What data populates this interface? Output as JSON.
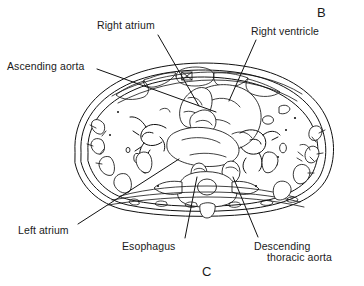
{
  "figure": {
    "type": "anatomical-cross-section",
    "modality": "CT axial thorax line drawing",
    "panel_letters": {
      "top_right": "B",
      "bottom_center": "C"
    }
  },
  "labels": [
    {
      "id": "right-atrium",
      "text": "Right atrium",
      "x": 97,
      "y": 20,
      "leader": {
        "x1": 158,
        "y1": 35,
        "x2": 199,
        "y2": 106
      }
    },
    {
      "id": "right-ventricle",
      "text": "Right ventricle",
      "x": 251,
      "y": 26,
      "leader": {
        "x1": 256,
        "y1": 40,
        "x2": 229,
        "y2": 101
      }
    },
    {
      "id": "ascending-aorta",
      "text": "Ascending aorta",
      "x": 7,
      "y": 61,
      "leader": {
        "x1": 97,
        "y1": 69,
        "x2": 216,
        "y2": 112
      }
    },
    {
      "id": "left-atrium",
      "text": "Left atrium",
      "x": 18,
      "y": 225,
      "leader": {
        "x1": 78,
        "y1": 224,
        "x2": 179,
        "y2": 159
      }
    },
    {
      "id": "esophagus",
      "text": "Esophagus",
      "x": 122,
      "y": 241,
      "leader": {
        "x1": 185,
        "y1": 238,
        "x2": 197,
        "y2": 177
      }
    },
    {
      "id": "descending-thoracic-aorta",
      "text": "Descending",
      "text_line2": "thoracic aorta",
      "x": 254,
      "y": 241,
      "x2": 267,
      "y2": 252,
      "leader": {
        "x1": 258,
        "y1": 237,
        "x2": 233,
        "y2": 177
      }
    }
  ],
  "colors": {
    "ink": "#111111",
    "background": "#ffffff",
    "text": "#1a1a1a"
  }
}
